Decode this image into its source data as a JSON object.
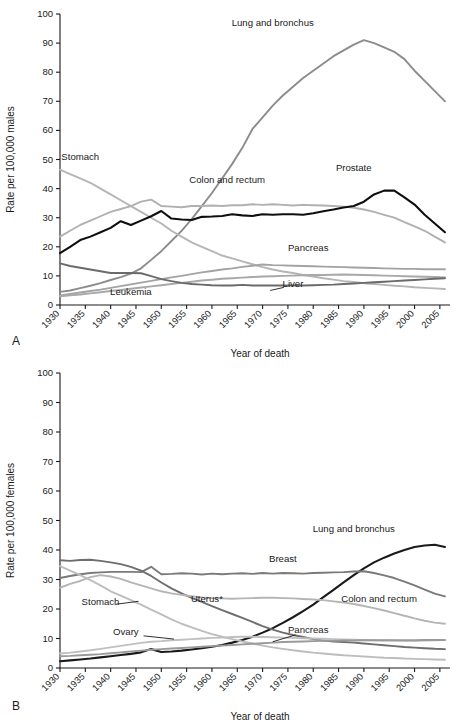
{
  "figure": {
    "panel_a_letter": "A",
    "panel_b_letter": "B"
  },
  "chart_data": [
    {
      "type": "line",
      "panel": "A",
      "title": "",
      "xlabel": "Year of death",
      "ylabel": "Rate per 100,000 males",
      "xlim": [
        1930,
        2007
      ],
      "ylim": [
        0,
        100
      ],
      "grid": false,
      "legend_position": "inline-annotations",
      "ytick_labels": [
        "0",
        "10",
        "20",
        "30",
        "40",
        "50",
        "60",
        "70",
        "80",
        "90",
        "100"
      ],
      "yticks": [
        0,
        10,
        20,
        30,
        40,
        50,
        60,
        70,
        80,
        90,
        100
      ],
      "xtick_labels": [
        "1930",
        "1935",
        "1940",
        "1945",
        "1950",
        "1955",
        "1960",
        "1965",
        "1970",
        "1975",
        "1980",
        "1985",
        "1990",
        "1995",
        "2000",
        "2005"
      ],
      "xticks": [
        1930,
        1935,
        1940,
        1945,
        1950,
        1955,
        1960,
        1965,
        1970,
        1975,
        1980,
        1985,
        1990,
        1995,
        2000,
        2005
      ],
      "x": [
        1930,
        1932,
        1934,
        1936,
        1938,
        1940,
        1942,
        1944,
        1946,
        1948,
        1950,
        1952,
        1954,
        1956,
        1958,
        1960,
        1962,
        1964,
        1966,
        1968,
        1970,
        1972,
        1974,
        1976,
        1978,
        1980,
        1982,
        1984,
        1986,
        1988,
        1990,
        1992,
        1994,
        1996,
        1998,
        2000,
        2002,
        2004,
        2006
      ],
      "series": [
        {
          "name": "Lung and bronchus",
          "color": "#8c8c8c",
          "width": 1.9,
          "label": "Lung and bronchus",
          "label_x": 1972,
          "label_y": 96,
          "values": [
            4.5,
            5.0,
            5.8,
            6.6,
            7.5,
            8.6,
            9.6,
            10.8,
            12.6,
            15.5,
            18.5,
            22.0,
            25.5,
            29.5,
            34.0,
            38.5,
            43.5,
            48.5,
            54.0,
            60.5,
            64.5,
            68.5,
            72.0,
            75.0,
            78.0,
            80.5,
            83.0,
            85.5,
            87.5,
            89.5,
            91.0,
            90.0,
            88.5,
            87.0,
            84.5,
            80.5,
            77.0,
            73.5,
            70.0
          ]
        },
        {
          "name": "Stomach",
          "color": "#b5b5b5",
          "width": 1.9,
          "label": "Stomach",
          "label_x": 1934,
          "label_y": 50,
          "values": [
            46.5,
            45.0,
            43.5,
            42.0,
            40.0,
            38.0,
            36.0,
            34.0,
            32.0,
            30.0,
            28.0,
            25.5,
            23.5,
            21.5,
            20.0,
            18.5,
            17.0,
            16.0,
            15.0,
            14.0,
            13.0,
            12.2,
            11.5,
            11.0,
            10.3,
            9.8,
            9.2,
            8.7,
            8.2,
            7.9,
            7.5,
            7.2,
            6.9,
            6.6,
            6.4,
            6.1,
            5.9,
            5.7,
            5.5
          ]
        },
        {
          "name": "Colon and rectum",
          "color": "#b0b0b0",
          "width": 1.9,
          "label": "Colon and rectum",
          "label_x": 1963,
          "label_y": 42,
          "values": [
            23.5,
            25.5,
            27.5,
            29.0,
            30.5,
            32.0,
            33.0,
            34.0,
            35.5,
            36.2,
            34.0,
            33.8,
            33.6,
            34.0,
            34.0,
            34.2,
            34.0,
            34.3,
            34.3,
            34.6,
            34.4,
            34.6,
            34.4,
            34.2,
            34.4,
            34.3,
            34.2,
            34.0,
            33.8,
            33.4,
            32.8,
            32.0,
            31.0,
            30.0,
            28.5,
            27.0,
            25.5,
            23.5,
            21.5
          ]
        },
        {
          "name": "Prostate",
          "color": "#0e0e0e",
          "width": 2.1,
          "label": "Prostate",
          "label_x": 1988,
          "label_y": 46,
          "values": [
            17.8,
            20.0,
            22.3,
            23.5,
            25.0,
            26.5,
            28.8,
            27.5,
            29.0,
            30.5,
            32.3,
            29.7,
            29.4,
            29.2,
            30.3,
            30.4,
            30.6,
            31.2,
            30.8,
            30.6,
            31.2,
            31.0,
            31.2,
            31.2,
            31.0,
            31.5,
            32.2,
            32.8,
            33.5,
            34.0,
            35.5,
            38.0,
            39.3,
            39.3,
            37.0,
            34.5,
            31.0,
            28.0,
            25.0
          ]
        },
        {
          "name": "Pancreas",
          "color": "#a3a3a3",
          "width": 1.9,
          "label": "Pancreas",
          "label_x": 1979,
          "label_y": 18.5,
          "values": [
            3.3,
            3.8,
            4.3,
            4.8,
            5.3,
            5.9,
            6.5,
            7.1,
            7.7,
            8.3,
            8.9,
            9.5,
            10.0,
            10.6,
            11.2,
            11.7,
            12.2,
            12.6,
            13.1,
            13.5,
            13.9,
            13.7,
            13.6,
            13.5,
            13.4,
            13.3,
            13.2,
            13.1,
            13.0,
            12.9,
            12.8,
            12.7,
            12.6,
            12.5,
            12.4,
            12.4,
            12.3,
            12.3,
            12.3
          ]
        },
        {
          "name": "Leukemia",
          "color": "#a8a8a8",
          "width": 1.9,
          "label": "Leukemia",
          "label_x": 1944,
          "label_y": 3.4,
          "values": [
            3.0,
            3.3,
            3.6,
            4.0,
            4.4,
            4.8,
            5.2,
            5.6,
            6.0,
            6.4,
            6.8,
            7.2,
            7.6,
            8.0,
            8.4,
            8.7,
            9.0,
            9.2,
            9.4,
            9.6,
            9.8,
            9.9,
            10.0,
            10.1,
            10.2,
            10.3,
            10.3,
            10.4,
            10.5,
            10.4,
            10.3,
            10.2,
            10.1,
            10.0,
            9.9,
            9.8,
            9.7,
            9.6,
            9.5
          ]
        },
        {
          "name": "Liver",
          "color": "#6a6a6a",
          "width": 1.9,
          "label": "Liver",
          "label_x": 1976,
          "label_y": 6.2,
          "values": [
            14.3,
            13.4,
            12.8,
            12.2,
            11.6,
            11.0,
            11.0,
            11.0,
            10.9,
            9.9,
            8.9,
            8.2,
            7.6,
            7.2,
            7.0,
            6.8,
            6.7,
            6.7,
            6.9,
            6.7,
            6.7,
            6.7,
            6.7,
            6.7,
            6.7,
            6.8,
            6.9,
            7.0,
            7.2,
            7.4,
            7.6,
            7.8,
            8.0,
            8.2,
            8.4,
            8.6,
            8.8,
            9.0,
            9.2
          ]
        }
      ],
      "annotations": [
        {
          "text": "Liver",
          "leader": true
        }
      ]
    },
    {
      "type": "line",
      "panel": "B",
      "title": "",
      "xlabel": "Year of death",
      "ylabel": "Rate per 100,000 females",
      "xlim": [
        1930,
        2007
      ],
      "ylim": [
        0,
        100
      ],
      "grid": false,
      "legend_position": "inline-annotations",
      "ytick_labels": [
        "0",
        "10",
        "20",
        "30",
        "40",
        "50",
        "60",
        "70",
        "80",
        "90",
        "100"
      ],
      "yticks": [
        0,
        10,
        20,
        30,
        40,
        50,
        60,
        70,
        80,
        90,
        100
      ],
      "xtick_labels": [
        "1930",
        "1935",
        "1940",
        "1945",
        "1950",
        "1955",
        "1960",
        "1965",
        "1970",
        "1975",
        "1980",
        "1985",
        "1990",
        "1995",
        "2000",
        "2005"
      ],
      "xticks": [
        1930,
        1935,
        1940,
        1945,
        1950,
        1955,
        1960,
        1965,
        1970,
        1975,
        1980,
        1985,
        1990,
        1995,
        2000,
        2005
      ],
      "x": [
        1930,
        1932,
        1934,
        1936,
        1938,
        1940,
        1942,
        1944,
        1946,
        1948,
        1950,
        1952,
        1954,
        1956,
        1958,
        1960,
        1962,
        1964,
        1966,
        1968,
        1970,
        1972,
        1974,
        1976,
        1978,
        1980,
        1982,
        1984,
        1986,
        1988,
        1990,
        1992,
        1994,
        1996,
        1998,
        2000,
        2002,
        2004,
        2006
      ],
      "series": [
        {
          "name": "Lung and bronchus",
          "color": "#1a1a1a",
          "width": 2.1,
          "label": "Lung and bronchus",
          "label_x": 1988,
          "label_y": 46,
          "values": [
            2.3,
            2.6,
            2.9,
            3.2,
            3.6,
            4.0,
            4.4,
            4.8,
            5.3,
            6.4,
            5.4,
            5.6,
            5.9,
            6.3,
            6.7,
            7.2,
            7.8,
            8.6,
            9.5,
            10.6,
            12.0,
            13.5,
            15.3,
            17.2,
            19.3,
            21.5,
            24.0,
            26.5,
            29.0,
            31.5,
            33.8,
            35.8,
            37.4,
            38.8,
            40.0,
            41.0,
            41.5,
            41.8,
            41.0
          ]
        },
        {
          "name": "Breast",
          "color": "#7a7a7a",
          "width": 1.9,
          "label": "Breast",
          "label_x": 1974,
          "label_y": 36,
          "values": [
            30.5,
            31.2,
            31.8,
            32.2,
            32.4,
            32.6,
            32.6,
            32.6,
            32.5,
            34.3,
            31.8,
            31.9,
            32.1,
            32.0,
            31.7,
            32.0,
            31.8,
            32.0,
            32.1,
            31.9,
            32.2,
            32.0,
            32.2,
            32.1,
            32.0,
            32.2,
            32.3,
            32.4,
            32.5,
            32.7,
            32.8,
            32.2,
            31.4,
            30.5,
            29.3,
            28.0,
            26.6,
            25.2,
            24.3
          ]
        },
        {
          "name": "Uterus*",
          "color": "#6e6e6e",
          "width": 1.9,
          "label": "Uterus*",
          "label_x": 1959,
          "label_y": 22.5,
          "values": [
            36.5,
            36.3,
            36.6,
            36.7,
            36.3,
            35.8,
            35.2,
            34.3,
            33.0,
            31.2,
            29.0,
            27.0,
            25.3,
            23.8,
            22.4,
            21.0,
            19.6,
            18.3,
            17.0,
            15.6,
            14.2,
            13.0,
            12.0,
            11.2,
            10.5,
            9.8,
            9.3,
            9.0,
            8.8,
            8.6,
            8.3,
            8.0,
            7.7,
            7.4,
            7.1,
            6.9,
            6.7,
            6.5,
            6.4
          ]
        },
        {
          "name": "Colon and rectum",
          "color": "#b5b5b5",
          "width": 1.9,
          "label": "Colon and rectum",
          "label_x": 1993,
          "label_y": 22.5,
          "values": [
            27.2,
            28.5,
            29.5,
            30.8,
            31.5,
            31.0,
            30.2,
            29.0,
            28.0,
            27.0,
            26.0,
            25.3,
            24.8,
            24.3,
            23.9,
            23.7,
            23.6,
            23.5,
            23.6,
            23.7,
            23.8,
            23.8,
            23.7,
            23.6,
            23.4,
            23.2,
            23.0,
            22.6,
            22.2,
            21.7,
            21.0,
            20.3,
            19.5,
            18.6,
            17.7,
            16.8,
            16.0,
            15.4,
            15.0
          ]
        },
        {
          "name": "Stomach",
          "color": "#bdbdbd",
          "width": 1.9,
          "label": "Stomach",
          "label_x": 1938,
          "label_y": 21.5,
          "values": [
            34.5,
            33.0,
            31.5,
            29.8,
            28.0,
            26.0,
            24.5,
            23.0,
            21.5,
            19.8,
            18.2,
            16.5,
            15.0,
            13.8,
            12.6,
            11.5,
            10.6,
            9.8,
            9.0,
            8.3,
            7.6,
            7.0,
            6.5,
            6.0,
            5.6,
            5.2,
            4.9,
            4.6,
            4.3,
            4.1,
            3.9,
            3.7,
            3.5,
            3.4,
            3.2,
            3.1,
            3.0,
            2.9,
            2.8
          ]
        },
        {
          "name": "Ovary",
          "color": "#c0c0c0",
          "width": 1.9,
          "label": "Ovary",
          "label_x": 1943,
          "label_y": 11.2,
          "values": [
            4.9,
            5.2,
            5.6,
            6.0,
            6.5,
            7.0,
            7.5,
            8.0,
            8.5,
            8.9,
            9.1,
            9.4,
            9.6,
            9.8,
            10.0,
            10.2,
            10.3,
            10.5,
            10.6,
            10.6,
            10.5,
            10.4,
            10.3,
            10.2,
            10.1,
            10.0,
            9.9,
            9.8,
            9.7,
            9.6,
            9.5,
            9.4,
            9.3,
            9.3,
            9.2,
            9.2,
            9.3,
            9.4,
            9.5
          ]
        },
        {
          "name": "Pancreas",
          "color": "#9a9a9a",
          "width": 1.9,
          "label": "Pancreas",
          "label_x": 1979,
          "label_y": 12.0,
          "values": [
            4.0,
            4.1,
            4.3,
            4.5,
            4.7,
            5.0,
            5.3,
            5.6,
            5.9,
            6.2,
            6.4,
            6.6,
            6.8,
            7.0,
            7.2,
            7.4,
            7.6,
            7.8,
            8.0,
            8.2,
            8.4,
            8.6,
            8.8,
            8.9,
            9.0,
            9.1,
            9.2,
            9.2,
            9.3,
            9.3,
            9.4,
            9.4,
            9.4,
            9.4,
            9.4,
            9.4,
            9.5,
            9.5,
            9.5
          ]
        }
      ],
      "annotations": [
        {
          "text": "Stomach",
          "leader": true
        },
        {
          "text": "Ovary",
          "leader": true
        },
        {
          "text": "Pancreas",
          "leader": true
        }
      ]
    }
  ]
}
